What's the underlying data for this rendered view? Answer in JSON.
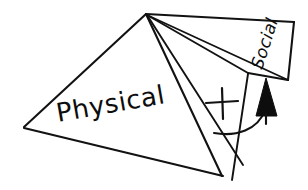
{
  "diagram": {
    "style": "hand-drawn black ink line drawing on white",
    "stroke_color": "#121212",
    "fill_color": "#ffffff",
    "arrow_color": "#0d0d0d",
    "labels": {
      "physical": "Physical",
      "social": "Social"
    },
    "symbols": {
      "plus": "+",
      "arrow": "up-arrow"
    },
    "geometry": {
      "apex": [
        146,
        14
      ],
      "left_vertex": [
        23,
        128
      ],
      "bottom_vertex": [
        222,
        176
      ],
      "panel_left_corner": [
        248,
        73
      ],
      "panel_top_right": [
        294,
        22
      ],
      "panel_bottom_right": [
        288,
        80
      ]
    },
    "annotations": {
      "physical_rotation_deg": -10,
      "social_rotation_deg": -72
    }
  }
}
